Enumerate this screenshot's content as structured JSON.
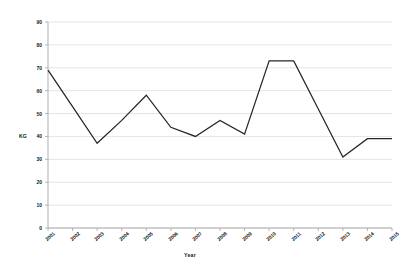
{
  "chart_data": {
    "type": "line",
    "title": "",
    "xlabel": "Year",
    "ylabel": "KG",
    "grid": true,
    "legend": false,
    "legend_position": "none",
    "line_color": "#262626",
    "categories": [
      "2001",
      "2002",
      "2003",
      "2004",
      "2005",
      "2006",
      "2007",
      "2008",
      "2009",
      "2010",
      "2011",
      "2012",
      "2013",
      "2014",
      "2015"
    ],
    "x": [
      2001,
      2002,
      2003,
      2004,
      2005,
      2006,
      2007,
      2008,
      2009,
      2010,
      2011,
      2012,
      2013,
      2014,
      2015
    ],
    "values": [
      69,
      53,
      37,
      47,
      58,
      44,
      40,
      47,
      41,
      73,
      73,
      52,
      31,
      39,
      39
    ],
    "series": [
      {
        "name": "KG",
        "values": [
          69,
          53,
          37,
          47,
          58,
          44,
          40,
          47,
          41,
          73,
          73,
          52,
          31,
          39,
          39
        ]
      }
    ],
    "xlim": [
      2001,
      2015
    ],
    "ylim": [
      0,
      90
    ],
    "ytick_labels": [
      "90",
      "80",
      "70",
      "60",
      "50",
      "40",
      "30",
      "20",
      "10",
      "0"
    ],
    "yticks": [
      90,
      80,
      70,
      60,
      50,
      40,
      30,
      20,
      10,
      0
    ],
    "xtick_labels": [
      "2001",
      "2002",
      "2003",
      "2004",
      "2005",
      "2006",
      "2007",
      "2008",
      "2009",
      "2010",
      "2011",
      "2012",
      "2013",
      "2014",
      "2015"
    ]
  },
  "axes": {
    "y_title": "KG",
    "x_title": "Year"
  },
  "colors": {
    "line": "#262626",
    "grid": "#d9d9d9",
    "axis": "#a6a6a6",
    "text": "#202020",
    "background": "#ffffff"
  }
}
